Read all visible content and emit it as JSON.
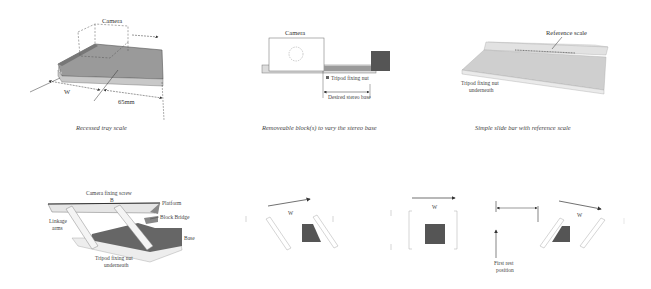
{
  "panels": {
    "recessed_tray": {
      "caption": "Recessed tray scale",
      "labels": {
        "camera": "Camera",
        "w": "W",
        "dist": "65mm"
      }
    },
    "removable_blocks": {
      "caption": "Removeable block(s) to vary the stereo base",
      "labels": {
        "camera": "Camera",
        "tripod": "Tripod fixing nut",
        "base": "Desired stereo base"
      }
    },
    "slide_bar": {
      "caption": "Simple slide bar with reference scale",
      "labels": {
        "ref": "Reference scale",
        "tripod1": "Tripod fixing nut",
        "tripod2": "underneath"
      }
    },
    "linkage": {
      "labels": {
        "screw": "Camera fixing screw",
        "platform": "Platform",
        "block": "Block Bridge",
        "arms1": "Linkage",
        "arms2": "arms",
        "base": "Base",
        "tripod1": "Tripod fixing nut",
        "tripod2": "underneath"
      }
    },
    "positions": {
      "w1": "W",
      "w2": "W",
      "w3": "W",
      "first1": "First rest",
      "first2": "position"
    }
  },
  "colors": {
    "dark_block": "#555555",
    "tray_fill": "#8a8a8a",
    "light_fill": "#dcdcdc",
    "line": "#333333"
  }
}
